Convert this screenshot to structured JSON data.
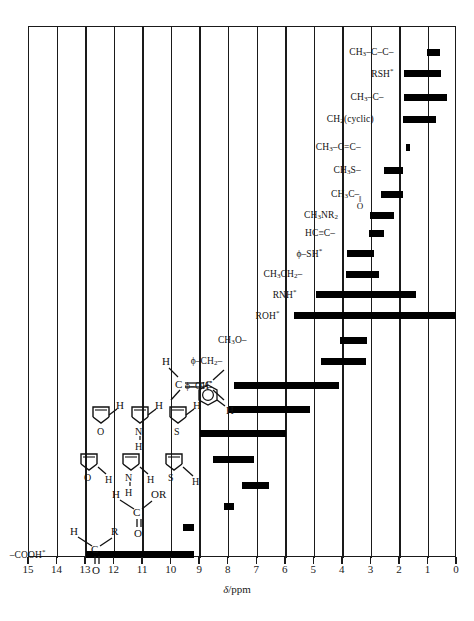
{
  "header": {
    "cut_text": ""
  },
  "axis": {
    "title_symbol": "δ",
    "title_unit": "/ppm",
    "ticks": [
      "15",
      "14",
      "13",
      "12",
      "11",
      "10",
      "9",
      "8",
      "7",
      "6",
      "5",
      "4",
      "3",
      "2",
      "1",
      "0"
    ],
    "min": 0,
    "max": 15,
    "direction": "reversed"
  },
  "caption": {
    "text": ""
  },
  "chart_data": {
    "type": "bar",
    "orientation": "horizontal-range",
    "title": "",
    "xlabel": "δ/ppm",
    "ylabel": "",
    "xlim": [
      15,
      0
    ],
    "grid": true,
    "legend": "none",
    "note": "Proton NMR chemical shift correlation chart; each bar is the δ range for a proton environment. * denotes shift strongly dependent on solvent/concentration/temperature.",
    "series": [
      {
        "label": "CH₃–C–C–",
        "html": "CH<sub>3</sub>–C–C–",
        "from": 1.05,
        "to": 0.6
      },
      {
        "label": "RSH*",
        "html": "RSH<sup>*</sup>",
        "from": 1.85,
        "to": 0.55
      },
      {
        "label": "CH₃–C–",
        "html": "CH<sub>3</sub>–C–",
        "from": 1.85,
        "to": 0.35
      },
      {
        "label": "CH₂ (cyclic)",
        "html": "CH<sub>2</sub>(cyclic)",
        "from": 1.9,
        "to": 0.75
      },
      {
        "label": "CH₃–C=C–",
        "html": "CH<sub>3</sub>–C=C–",
        "from": 1.8,
        "to": 1.65
      },
      {
        "label": "CH₃S–",
        "html": "CH<sub>3</sub>S–",
        "from": 2.55,
        "to": 1.9
      },
      {
        "label": "CH₃C(=O)–",
        "html": "CH<sub>3</sub>C–",
        "from": 2.65,
        "to": 1.9
      },
      {
        "label": "CH₃NR₂",
        "html": "CH<sub>3</sub>NR<sub>2</sub>",
        "from": 3.05,
        "to": 2.2
      },
      {
        "label": "HC≡C–",
        "html": "HC≡C–",
        "from": 3.1,
        "to": 2.55
      },
      {
        "label": "ϕ–SH*",
        "html": "ϕ–SH<sup>*</sup>",
        "from": 3.85,
        "to": 2.9
      },
      {
        "label": "CH₃CH₂–",
        "html": "CH<sub>3</sub>CH<sub>2</sub>–",
        "from": 3.9,
        "to": 2.75
      },
      {
        "label": "RNH*",
        "html": "RNH<sup>*</sup>",
        "from": 4.95,
        "to": 1.45
      },
      {
        "label": "ROH*",
        "html": "ROH<sup>*</sup>",
        "from": 5.7,
        "to": 0.05
      },
      {
        "label": "CH₃O–",
        "html": "CH<sub>3</sub>O–",
        "from": 4.1,
        "to": 3.15
      },
      {
        "label": "ϕ–CH₂–",
        "html": "ϕ–CH<sub>2</sub>–",
        "from": 4.75,
        "to": 3.2
      },
      {
        "label": "ϕ–OH*",
        "html": "ϕ–OH<sup>*</sup>",
        "from": 7.8,
        "to": 4.15
      },
      {
        "label": "alkene-CH",
        "html": "",
        "from": 8.0,
        "to": 5.15
      },
      {
        "label": "aromatic-CH",
        "html": "",
        "from": 9.0,
        "to": 6.0
      },
      {
        "label": "heteroaryl-alpha-CH",
        "html": "",
        "from": 8.55,
        "to": 7.1
      },
      {
        "label": "heteroaryl-beta-CH",
        "html": "",
        "from": 7.55,
        "to": 6.6
      },
      {
        "label": "HC(=O)OR",
        "html": "",
        "from": 8.15,
        "to": 7.8
      },
      {
        "label": "RCHO",
        "html": "",
        "from": 9.6,
        "to": 9.2
      },
      {
        "label": "–COOH*",
        "html": "–COOH<sup>*</sup>",
        "from": 13.0,
        "to": 9.2
      }
    ],
    "labels_on_chart": [
      {
        "text": "CH₃–C–C–",
        "at_ppm": 2.15
      },
      {
        "text": "RSH*",
        "at_ppm": 2.15
      },
      {
        "text": "CH₃–C–",
        "at_ppm": 2.5
      },
      {
        "text": "CH₂(cyclic)",
        "at_ppm": 2.85
      },
      {
        "text": "CH₃–C=C–",
        "at_ppm": 3.3
      },
      {
        "text": "CH₃S–",
        "at_ppm": 3.3
      },
      {
        "text": "CH₃C– (=O)",
        "at_ppm": 3.35
      },
      {
        "text": "CH₃NR₂",
        "at_ppm": 4.1
      },
      {
        "text": "HC≡C–",
        "at_ppm": 4.2
      },
      {
        "text": "ϕ–SH*",
        "at_ppm": 4.65
      },
      {
        "text": "CH₃CH₂–",
        "at_ppm": 5.35
      },
      {
        "text": "RNH*",
        "at_ppm": 5.55
      },
      {
        "text": "ROH*",
        "at_ppm": 6.15
      },
      {
        "text": "CH₃O–",
        "at_ppm": 7.3
      },
      {
        "text": "ϕ–CH₂–",
        "at_ppm": 8.15
      },
      {
        "text": "ϕ–OH*",
        "at_ppm": 8.5
      },
      {
        "text": "–COOH*",
        "at_ppm": 14.35
      }
    ]
  },
  "structures": {
    "alkene": {
      "atoms": [
        "H",
        "C",
        "C"
      ],
      "name": "vinyl-proton-structure"
    },
    "benzene": {
      "atoms": [
        "H"
      ],
      "name": "benzene-ring-structure"
    },
    "furan_a": {
      "atoms": [
        "O",
        "H"
      ],
      "name": "furan-alpha-structure"
    },
    "pyrrole_a": {
      "atoms": [
        "N",
        "H",
        "H"
      ],
      "name": "pyrrole-alpha-structure"
    },
    "thiophene_a": {
      "atoms": [
        "S",
        "H"
      ],
      "name": "thiophene-alpha-structure"
    },
    "furan_b": {
      "atoms": [
        "O",
        "H"
      ],
      "name": "furan-beta-structure"
    },
    "pyrrole_b": {
      "atoms": [
        "N",
        "H",
        "H"
      ],
      "name": "pyrrole-beta-structure"
    },
    "thiophene_b": {
      "atoms": [
        "S",
        "H"
      ],
      "name": "thiophene-beta-structure"
    },
    "formate": {
      "atoms": [
        "H",
        "C",
        "OR",
        "O"
      ],
      "name": "formate-ester-structure"
    },
    "aldehyde": {
      "atoms": [
        "H",
        "C",
        "R",
        "O"
      ],
      "name": "aldehyde-structure"
    }
  }
}
